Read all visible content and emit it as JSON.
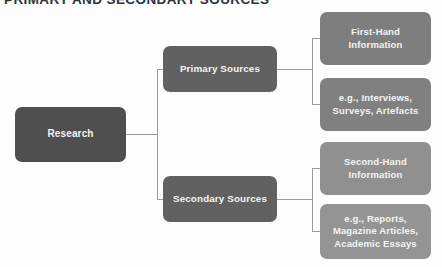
{
  "heading": {
    "text": "PRIMARY AND SECONDARY SOURCES"
  },
  "diagram": {
    "type": "tree",
    "root": {
      "label": "Research"
    },
    "branches": [
      {
        "label": "Primary Sources",
        "children": [
          {
            "label": "First-Hand Information"
          },
          {
            "label": "e.g., Interviews, Surveys, Artefacts"
          }
        ]
      },
      {
        "label": "Secondary Sources",
        "children": [
          {
            "label": "Second-Hand Information"
          },
          {
            "label": "e.g., Reports, Magazine Articles, Academic Essays"
          }
        ]
      }
    ],
    "node_lines": {
      "root": [
        "Research"
      ],
      "primary": [
        "Primary Sources"
      ],
      "secondary": [
        "Secondary Sources"
      ],
      "first_hand": [
        "First-Hand",
        "Information"
      ],
      "eg_primary": [
        "e.g., Interviews,",
        "Surveys, Artefacts"
      ],
      "second_hand": [
        "Second-Hand",
        "Information"
      ],
      "eg_secondary": [
        "e.g., Reports,",
        "Magazine Articles,",
        "Academic Essays"
      ]
    },
    "colors": {
      "background": "#fdfdfd",
      "root_box": "#4f4f4f",
      "level2_box": "#616161",
      "level3_box_upper": "#7e7e7e",
      "level3_box_lower": "#909090",
      "connector": "#9a9a9a",
      "node_text": "#f4f4f4",
      "heading_text": "#2e3340"
    }
  }
}
